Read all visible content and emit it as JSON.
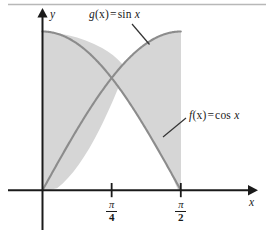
{
  "figure": {
    "title": "",
    "background_color": "#ffffff",
    "top_rule_color": "#b8b8b8",
    "axis_color": "#1a1a1a",
    "curve_color": "#8c8c8c",
    "shade_color": "#d6d6d6",
    "leader_color": "#333333"
  },
  "labels": {
    "g_func_name": "g",
    "g_arg": "(x)",
    "equals": "=",
    "g_expr_fn": "sin",
    "g_expr_var": "x",
    "f_func_name": "f",
    "f_arg": "(x)",
    "f_expr_fn": "cos",
    "f_expr_var": "x",
    "y_axis": "y",
    "x_axis": "x"
  },
  "ticks": [
    {
      "name": "pi-over-4",
      "numerator": "π",
      "denominator": "4",
      "x_value": 0.7853981634
    },
    {
      "name": "pi-over-2",
      "numerator": "π",
      "denominator": "2",
      "x_value": 1.5707963268
    }
  ],
  "chart_data": {
    "type": "line",
    "title": "",
    "xlabel": "x",
    "ylabel": "y",
    "xlim": [
      0,
      1.5707963268
    ],
    "ylim": [
      0,
      1
    ],
    "grid": false,
    "legend": "inline-annotations",
    "xticks": [
      0.7853981634,
      1.5707963268
    ],
    "xticklabels": [
      "π/4",
      "π/2"
    ],
    "yticks": [],
    "yticklabels": [],
    "series": [
      {
        "name": "f(x) = cos x",
        "expression": "cos(x)",
        "label": "f(x)  =  cos x",
        "color": "#8c8c8c",
        "x": [
          0,
          0.19634954,
          0.39269908,
          0.58904862,
          0.78539816,
          0.9817477,
          1.17809725,
          1.37444679,
          1.57079633
        ],
        "y": [
          1.0,
          0.98078528,
          0.92387953,
          0.83146961,
          0.70710678,
          0.55557023,
          0.38268343,
          0.19509032,
          0.0
        ]
      },
      {
        "name": "g(x) = sin x",
        "expression": "sin(x)",
        "label": "g(x)  =  sin x",
        "color": "#8c8c8c",
        "x": [
          0,
          0.19634954,
          0.39269908,
          0.58904862,
          0.78539816,
          0.9817477,
          1.17809725,
          1.37444679,
          1.57079633
        ],
        "y": [
          0.0,
          0.19509032,
          0.38268343,
          0.55557023,
          0.70710678,
          0.83146961,
          0.92387953,
          0.98078528,
          1.0
        ]
      }
    ],
    "shaded_regions": [
      {
        "name": "region-left-cos-above-sin",
        "between": [
          "cos(x)",
          "sin(x)"
        ],
        "x_range": [
          0,
          0.7853981634
        ],
        "fill": "#d6d6d6"
      },
      {
        "name": "region-right-sin-above-cos",
        "between": [
          "sin(x)",
          "cos(x)"
        ],
        "x_range": [
          0.7853981634,
          1.5707963268
        ],
        "fill": "#d6d6d6"
      }
    ],
    "intersection": {
      "x": 0.7853981634,
      "y": 0.7071067812
    },
    "annotations": [
      {
        "name": "g-annotation",
        "text": "g(x)  =  sin x",
        "points_to": [
          1.0,
          0.845
        ]
      },
      {
        "name": "f-annotation",
        "text": "f(x)  =  cos x",
        "points_to": [
          1.42,
          0.245
        ]
      }
    ]
  }
}
